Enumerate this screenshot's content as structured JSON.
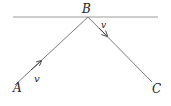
{
  "diagram": {
    "points": {
      "A": {
        "label": "A"
      },
      "B": {
        "label": "B"
      },
      "C": {
        "label": "C"
      }
    },
    "velocity_labels": {
      "incoming": "v",
      "outgoing": "v"
    },
    "colors": {
      "surface": "#9a9a9a",
      "path": "#7a7a7a",
      "text": "#222222"
    }
  }
}
